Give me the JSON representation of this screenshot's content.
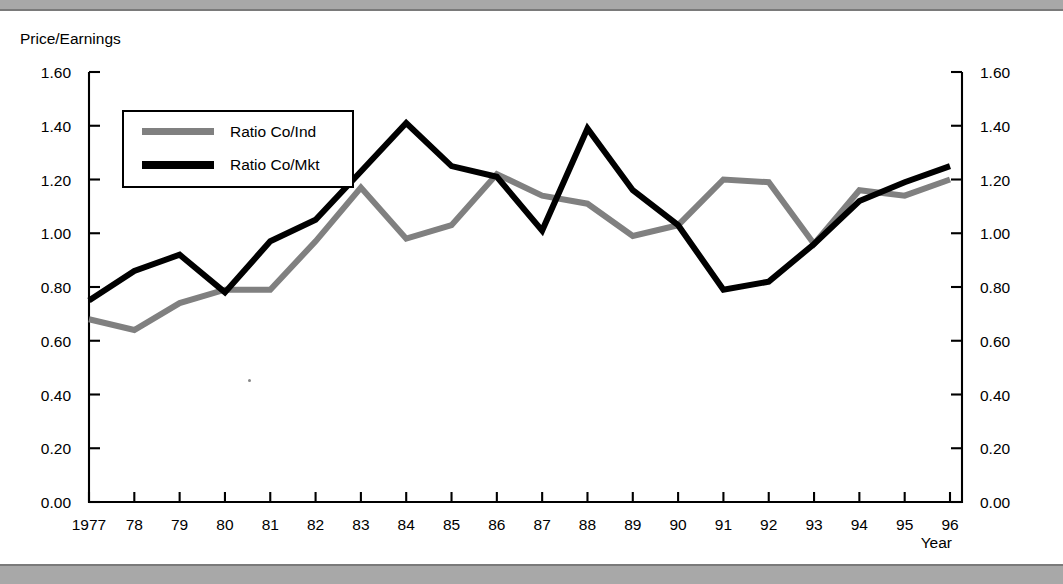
{
  "window": {
    "top_band_color": "#a8a8a8",
    "bottom_band_color": "#a8a8a8"
  },
  "chart_titles": {
    "y_axis_title": "Price/Earnings",
    "x_axis_title": "Year"
  },
  "legend": {
    "entries": [
      {
        "label": "Ratio Co/Ind",
        "color": "#808080"
      },
      {
        "label": "Ratio Co/Mkt",
        "color": "#000000"
      }
    ]
  },
  "chart_data": {
    "type": "line",
    "title": "Price/Earnings",
    "xlabel": "Year",
    "ylabel": "Price/Earnings",
    "ylim": [
      0.0,
      1.6
    ],
    "ytick_labels": [
      "1.60",
      "1.40",
      "1.20",
      "1.00",
      "0.80",
      "0.60",
      "0.40",
      "0.20",
      "0.00"
    ],
    "ytick_values": [
      1.6,
      1.4,
      1.2,
      1.0,
      0.8,
      0.6,
      0.4,
      0.2,
      0.0
    ],
    "right_axis": true,
    "right_ytick_labels": [
      "1.60",
      "1.40",
      "1.20",
      "1.00",
      "0.80",
      "0.60",
      "0.40",
      "0.20",
      "0.00"
    ],
    "grid": false,
    "legend_position": "upper-left-inside",
    "categories": [
      "1977",
      "78",
      "79",
      "80",
      "81",
      "82",
      "83",
      "84",
      "85",
      "86",
      "87",
      "88",
      "89",
      "90",
      "91",
      "92",
      "93",
      "94",
      "95",
      "96"
    ],
    "x": [
      1977,
      1978,
      1979,
      1980,
      1981,
      1982,
      1983,
      1984,
      1985,
      1986,
      1987,
      1988,
      1989,
      1990,
      1991,
      1992,
      1993,
      1994,
      1995,
      1996
    ],
    "series": [
      {
        "name": "Ratio Co/Ind",
        "color": "#808080",
        "line_width": 6,
        "values": [
          0.68,
          0.64,
          0.74,
          0.79,
          0.79,
          0.97,
          1.17,
          0.98,
          1.03,
          1.22,
          1.14,
          1.11,
          0.99,
          1.03,
          1.2,
          1.19,
          0.96,
          1.16,
          1.14,
          1.2
        ]
      },
      {
        "name": "Ratio Co/Mkt",
        "color": "#000000",
        "line_width": 6,
        "values": [
          0.75,
          0.86,
          0.92,
          0.78,
          0.97,
          1.05,
          1.23,
          1.41,
          1.25,
          1.21,
          1.01,
          1.39,
          1.16,
          1.03,
          0.79,
          0.82,
          0.96,
          1.12,
          1.19,
          1.25
        ]
      }
    ]
  }
}
